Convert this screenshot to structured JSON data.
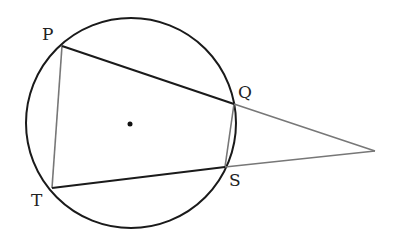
{
  "diagram": {
    "type": "geometry",
    "circle": {
      "cx": 131,
      "cy": 123,
      "r": 105,
      "center_dot": true
    },
    "points": {
      "P": {
        "label": "P",
        "x": 62,
        "y": 46
      },
      "Q": {
        "label": "Q",
        "x": 234,
        "y": 104
      },
      "S": {
        "label": "S",
        "x": 225,
        "y": 167
      },
      "T": {
        "label": "T",
        "x": 52,
        "y": 188
      },
      "apex": {
        "label": "",
        "x": 375,
        "y": 151
      }
    },
    "segments": [
      {
        "from": "P",
        "to": "Q",
        "style": "dark"
      },
      {
        "from": "T",
        "to": "S",
        "style": "dark"
      },
      {
        "from": "P",
        "to": "T",
        "style": "gray"
      },
      {
        "from": "Q",
        "to": "S",
        "style": "gray"
      },
      {
        "from": "Q",
        "to": "apex",
        "style": "gray"
      },
      {
        "from": "S",
        "to": "apex",
        "style": "gray"
      }
    ],
    "colors": {
      "dark": "#1a1a1a",
      "gray": "#777777",
      "circle": "#1a1a1a",
      "background": "#ffffff"
    },
    "labels": {
      "P": "P",
      "Q": "Q",
      "S": "S",
      "T": "T"
    }
  }
}
